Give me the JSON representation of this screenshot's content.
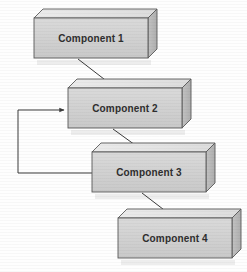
{
  "diagram": {
    "background_color": "#fefefe",
    "canvas": {
      "width": 247,
      "height": 272
    },
    "style": {
      "box_front_color": "#d2d2d2",
      "box_top_color": "#e4e4e4",
      "box_side_color": "#b6b6b6",
      "box_border_color": "#555555",
      "label_color": "#2e2e2e",
      "connector_color": "#3a3a3a",
      "shadow_color": "#e8e8e8"
    },
    "nodes": [
      {
        "id": "component-1",
        "label": "Component 1",
        "x": 34,
        "y": 18,
        "width": 114,
        "height": 40,
        "depth": 9,
        "label_x": 91,
        "label_y": 42
      },
      {
        "id": "component-2",
        "label": "Component 2",
        "x": 68,
        "y": 88,
        "width": 114,
        "height": 40,
        "depth": 9,
        "label_x": 125,
        "label_y": 112
      },
      {
        "id": "component-3",
        "label": "Component 3",
        "x": 92,
        "y": 152,
        "width": 114,
        "height": 40,
        "depth": 9,
        "label_x": 149,
        "label_y": 176
      },
      {
        "id": "component-4",
        "label": "Component 4",
        "x": 118,
        "y": 218,
        "width": 114,
        "height": 40,
        "depth": 9,
        "label_x": 175,
        "label_y": 242
      }
    ],
    "connectors": [
      {
        "id": "c1-to-c2",
        "kind": "diagonal",
        "from": "component-1",
        "to": "component-2",
        "points": "78,59 113,86",
        "arrowhead": "solid-triangle"
      },
      {
        "id": "c2-to-c3",
        "kind": "diagonal",
        "from": "component-2",
        "to": "component-3",
        "points": "113,129 142,150",
        "arrowhead": "solid-triangle"
      },
      {
        "id": "c3-to-c4",
        "kind": "diagonal",
        "from": "component-3",
        "to": "component-4",
        "points": "142,193 172,216",
        "arrowhead": "solid-triangle"
      },
      {
        "id": "c3-to-c2-feedback",
        "kind": "orthogonal",
        "from": "component-3",
        "to": "component-2",
        "points": "92,173 18,173 18,110 64,110",
        "arrowhead": "solid-triangle"
      }
    ]
  }
}
